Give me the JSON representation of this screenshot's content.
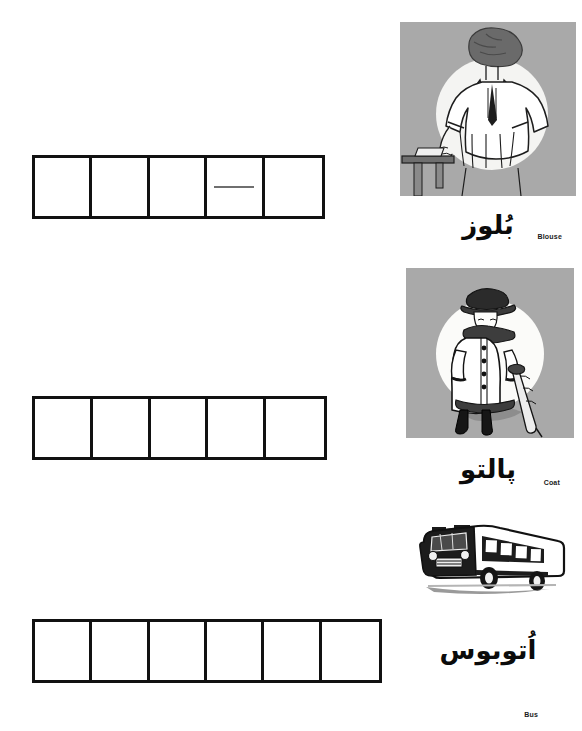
{
  "page": {
    "background": "#ffffff",
    "ink": "#111111"
  },
  "exercise_rows": [
    {
      "id": "row-1",
      "answer_word": "بُلوز",
      "cell_count": 5,
      "cells": [
        "",
        "",
        "",
        "—",
        ""
      ],
      "hint_cell_index": 3,
      "hint_mark": "dash"
    },
    {
      "id": "row-2",
      "answer_word": "پالتو",
      "cell_count": 5,
      "cells": [
        "",
        "",
        "",
        "",
        ""
      ],
      "hint_cell_index": -1,
      "hint_mark": ""
    },
    {
      "id": "row-3",
      "answer_word": "اُتوبوس",
      "cell_count": 6,
      "cells": [
        "",
        "",
        "",
        "",
        "",
        ""
      ],
      "hint_cell_index": -1,
      "hint_mark": ""
    }
  ],
  "picture_cards": [
    {
      "id": "card-blouse",
      "english_label": "Blouse",
      "persian_word": "بُلوز",
      "illustration": "woman-wearing-blouse-illustration",
      "panel_color": "#a9a9a9"
    },
    {
      "id": "card-coat",
      "english_label": "Coat",
      "persian_word": "پالتو",
      "illustration": "woman-in-coat-with-umbrella-illustration",
      "panel_color": "#a9a9a9"
    },
    {
      "id": "card-bus",
      "english_label": "Bus",
      "persian_word": "اُتوبوس",
      "illustration": "bus-illustration",
      "panel_color": "#ffffff"
    }
  ]
}
